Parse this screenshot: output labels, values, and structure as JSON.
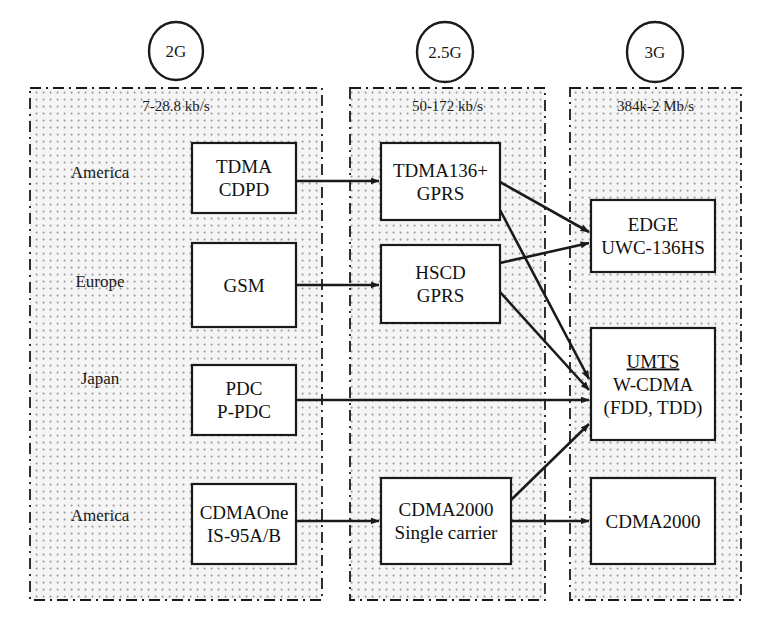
{
  "diagram": {
    "colors": {
      "stroke": "#1a1a1a",
      "panel_fill": "#f4f4f4",
      "panel_dot": "#9a9a9a",
      "node_fill": "#ffffff",
      "background": "#ffffff"
    },
    "eras": [
      {
        "id": "2g",
        "label": "2G",
        "rate": "7-28.8 kb/s",
        "circle_cx": 176,
        "circle_cy": 51,
        "circle_r": 27,
        "panel": {
          "x": 30,
          "y": 88,
          "w": 292,
          "h": 512
        }
      },
      {
        "id": "2_5g",
        "label": "2.5G",
        "rate": "50-172 kb/s",
        "circle_cx": 445,
        "circle_cy": 52,
        "circle_r": 28,
        "panel": {
          "x": 350,
          "y": 88,
          "w": 195,
          "h": 512
        }
      },
      {
        "id": "3g",
        "label": "3G",
        "rate": "384k-2 Mb/s",
        "circle_cx": 655,
        "circle_cy": 52,
        "circle_r": 28,
        "panel": {
          "x": 570,
          "y": 88,
          "w": 171,
          "h": 512
        }
      }
    ],
    "regions": [
      {
        "id": "america-tdma",
        "label": "America",
        "x": 100,
        "y": 178
      },
      {
        "id": "europe",
        "label": "Europe",
        "x": 100,
        "y": 287
      },
      {
        "id": "japan",
        "label": "Japan",
        "x": 100,
        "y": 384
      },
      {
        "id": "america-cdma",
        "label": "America",
        "x": 100,
        "y": 521
      }
    ],
    "nodes": [
      {
        "id": "tdma-cdpd",
        "era": "2g",
        "x": 192,
        "y": 143,
        "w": 104,
        "h": 70,
        "lines": [
          "TDMA",
          "CDPD"
        ],
        "underline_first": false
      },
      {
        "id": "gsm",
        "era": "2g",
        "x": 192,
        "y": 243,
        "w": 104,
        "h": 84,
        "lines": [
          "GSM"
        ],
        "underline_first": false
      },
      {
        "id": "pdc-ppdc",
        "era": "2g",
        "x": 192,
        "y": 365,
        "w": 104,
        "h": 70,
        "lines": [
          "PDC",
          "P-PDC"
        ],
        "underline_first": false
      },
      {
        "id": "cdmaone",
        "era": "2g",
        "x": 192,
        "y": 484,
        "w": 104,
        "h": 80,
        "lines": [
          "CDMAOne",
          "IS-95A/B"
        ],
        "underline_first": false
      },
      {
        "id": "tdma136plus",
        "era": "2_5g",
        "x": 381,
        "y": 143,
        "w": 119,
        "h": 77,
        "lines": [
          "TDMA136+",
          "GPRS"
        ],
        "underline_first": false
      },
      {
        "id": "hscd-gprs",
        "era": "2_5g",
        "x": 381,
        "y": 245,
        "w": 119,
        "h": 78,
        "lines": [
          "HSCD",
          "GPRS"
        ],
        "underline_first": false
      },
      {
        "id": "cdma2000-sc",
        "era": "2_5g",
        "x": 381,
        "y": 478,
        "w": 130,
        "h": 86,
        "lines": [
          "CDMA2000",
          "Single carrier"
        ],
        "underline_first": false
      },
      {
        "id": "edge-uwc",
        "era": "3g",
        "x": 591,
        "y": 200,
        "w": 124,
        "h": 72,
        "lines": [
          "EDGE",
          "UWC-136HS"
        ],
        "underline_first": false
      },
      {
        "id": "umts-wcdma",
        "era": "3g",
        "x": 591,
        "y": 328,
        "w": 124,
        "h": 112,
        "lines": [
          "UMTS",
          "W-CDMA",
          "(FDD, TDD)"
        ],
        "underline_first": true
      },
      {
        "id": "cdma2000-3g",
        "era": "3g",
        "x": 591,
        "y": 478,
        "w": 124,
        "h": 86,
        "lines": [
          "CDMA2000"
        ],
        "underline_first": false
      }
    ],
    "edges": [
      {
        "id": "tdma-to-tdma136",
        "from": "tdma-cdpd",
        "to": "tdma136plus",
        "x1": 296,
        "y1": 181,
        "x2": 379,
        "y2": 181
      },
      {
        "id": "gsm-to-hscd",
        "from": "gsm",
        "to": "hscd-gprs",
        "x1": 296,
        "y1": 285,
        "x2": 379,
        "y2": 285
      },
      {
        "id": "tdma136-to-edge",
        "from": "tdma136plus",
        "to": "edge-uwc",
        "x1": 500,
        "y1": 182,
        "x2": 589,
        "y2": 232
      },
      {
        "id": "tdma136-to-umts",
        "from": "tdma136plus",
        "to": "umts-wcdma",
        "x1": 500,
        "y1": 210,
        "x2": 589,
        "y2": 379
      },
      {
        "id": "hscd-to-edge",
        "from": "hscd-gprs",
        "to": "edge-uwc",
        "x1": 500,
        "y1": 263,
        "x2": 589,
        "y2": 243
      },
      {
        "id": "hscd-to-umts",
        "from": "hscd-gprs",
        "to": "umts-wcdma",
        "x1": 500,
        "y1": 292,
        "x2": 589,
        "y2": 390
      },
      {
        "id": "pdc-to-umts",
        "from": "pdc-ppdc",
        "to": "umts-wcdma",
        "x1": 296,
        "y1": 400,
        "x2": 589,
        "y2": 400
      },
      {
        "id": "cdmaone-to-cdma2000",
        "from": "cdmaone",
        "to": "cdma2000-sc",
        "x1": 296,
        "y1": 521,
        "x2": 379,
        "y2": 521
      },
      {
        "id": "cdma2000sc-to-umts",
        "from": "cdma2000-sc",
        "to": "umts-wcdma",
        "x1": 511,
        "y1": 500,
        "x2": 589,
        "y2": 424
      },
      {
        "id": "cdma2000sc-to-3g",
        "from": "cdma2000-sc",
        "to": "cdma2000-3g",
        "x1": 511,
        "y1": 521,
        "x2": 589,
        "y2": 521
      }
    ]
  }
}
